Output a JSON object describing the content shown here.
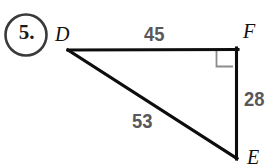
{
  "figure": {
    "problem_number": "5.",
    "shape": "right-triangle",
    "vertices": [
      {
        "id": "D",
        "label": "D",
        "x": 68,
        "y": 50
      },
      {
        "id": "F",
        "label": "F",
        "x": 237,
        "y": 49
      },
      {
        "id": "E",
        "label": "E",
        "x": 237,
        "y": 158
      }
    ],
    "sides": [
      {
        "id": "DF",
        "label": "45",
        "from": "D",
        "to": "F",
        "role": "adjacent-leg"
      },
      {
        "id": "FE",
        "label": "28",
        "from": "F",
        "to": "E",
        "role": "opposite-leg"
      },
      {
        "id": "DE",
        "label": "53",
        "from": "D",
        "to": "E",
        "role": "hypotenuse"
      }
    ],
    "right_angle_at": "F",
    "colors": {
      "background": "#ffffff",
      "triangle_stroke": "#0d0d0d",
      "right_angle_stroke": "#8c8c8e",
      "measure_text": "#58585a",
      "vertex_text": "#111111",
      "circle_stroke": "#3a3a3c",
      "number_text": "#1a1a1a"
    },
    "labels": {
      "vertex_d": "D",
      "vertex_f": "F",
      "vertex_e": "E",
      "side_df": "45",
      "side_fe": "28",
      "side_de": "53"
    }
  }
}
